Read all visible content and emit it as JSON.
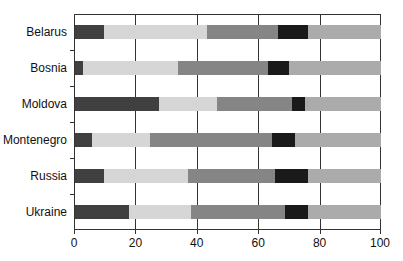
{
  "chart_data": {
    "type": "bar",
    "orientation": "horizontal",
    "stacked": true,
    "title": "",
    "xlabel": "",
    "ylabel": "",
    "xlim": [
      0,
      100
    ],
    "xticks": [
      0,
      20,
      40,
      60,
      80,
      100
    ],
    "grid": "vertical lines at x ticks",
    "legend": "none",
    "categories": [
      "Belarus",
      "Bosnia",
      "Moldova",
      "Montenegro",
      "Russia",
      "Ukraine"
    ],
    "series": [
      {
        "name": "Segment 1",
        "color": "#404040",
        "values": [
          9.5,
          2.5,
          27.5,
          5.5,
          9.5,
          17.5
        ]
      },
      {
        "name": "Segment 2",
        "color": "#d6d6d6",
        "values": [
          33.5,
          31,
          19,
          19,
          27.5,
          20.5
        ]
      },
      {
        "name": "Segment 3",
        "color": "#858585",
        "values": [
          23.5,
          29.5,
          24.5,
          40,
          28.5,
          30.5
        ]
      },
      {
        "name": "Segment 4",
        "color": "#1a1a1a",
        "values": [
          9.5,
          7,
          4,
          7.5,
          10.5,
          7.5
        ]
      },
      {
        "name": "Segment 5",
        "color": "#ababab",
        "values": [
          24,
          30,
          25,
          28,
          24,
          24
        ]
      }
    ]
  }
}
